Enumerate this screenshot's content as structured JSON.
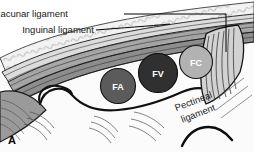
{
  "figure": {
    "panel_letter": "A",
    "type": "anatomical-illustration"
  },
  "labels": {
    "lacunar": "Lacunar ligament",
    "inguinal": "Inguinal ligament",
    "pectineal_line1": "Pectineal",
    "pectineal_line2": "ligament"
  },
  "structures": [
    {
      "abbr": "FA",
      "name": "femoral-artery",
      "color": "#5b5b5b",
      "cx": 118,
      "cy": 86,
      "r": 17.5
    },
    {
      "abbr": "FV",
      "name": "femoral-vein",
      "color": "#303030",
      "cx": 158,
      "cy": 73,
      "r": 19.5
    },
    {
      "abbr": "FC",
      "name": "femoral-canal",
      "color": "#b2b2b2",
      "cx": 196,
      "cy": 62,
      "r": 16.5
    }
  ],
  "colors": {
    "background": "#ffffff",
    "outline": "#000000",
    "ligament_band_light": "#d9d9d9",
    "ligament_band_mid": "#a8a8a8",
    "ligament_band_dark": "#8a8a8a",
    "tissue_light": "#efefef",
    "text": "#1a1a1a"
  }
}
